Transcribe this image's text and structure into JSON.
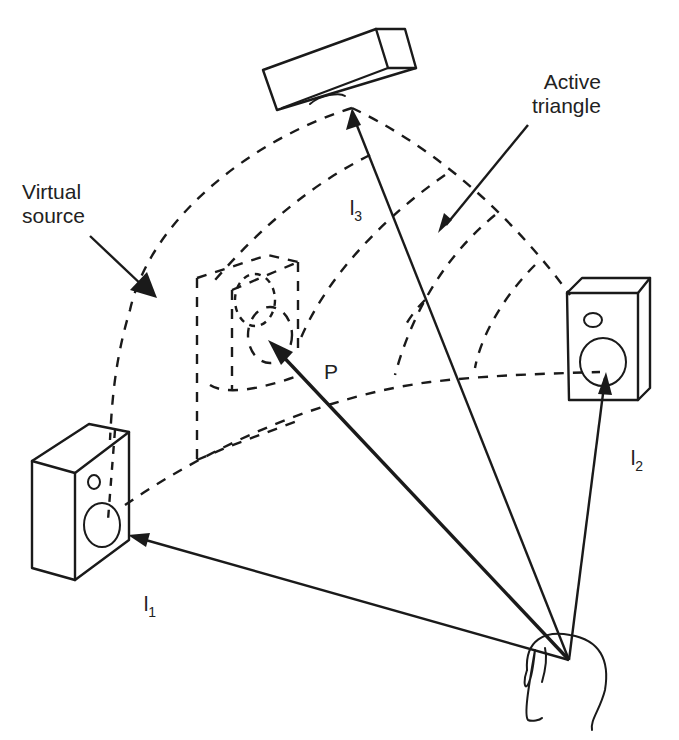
{
  "diagram": {
    "type": "vector-base-amplitude-panning",
    "labels": {
      "virtual_source": "Virtual\nsource",
      "active_triangle": "Active\ntriangle",
      "l1_main": "l",
      "l1_sub": "1",
      "l2_main": "l",
      "l2_sub": "2",
      "l3_main": "l",
      "l3_sub": "3",
      "p": "P"
    },
    "nodes": [
      {
        "id": "loudspeaker-1",
        "position": "left"
      },
      {
        "id": "loudspeaker-2",
        "position": "right"
      },
      {
        "id": "loudspeaker-3",
        "position": "top"
      },
      {
        "id": "virtual-source",
        "position": "center"
      },
      {
        "id": "listener",
        "position": "bottom-right"
      }
    ],
    "vectors": [
      {
        "from": "listener",
        "to": "loudspeaker-1",
        "label": "l1"
      },
      {
        "from": "listener",
        "to": "loudspeaker-2",
        "label": "l2"
      },
      {
        "from": "listener",
        "to": "loudspeaker-3",
        "label": "l3"
      },
      {
        "from": "listener",
        "to": "virtual-source",
        "label": "P"
      }
    ],
    "colors": {
      "ink": "#1a1a1a",
      "background": "#ffffff"
    }
  }
}
